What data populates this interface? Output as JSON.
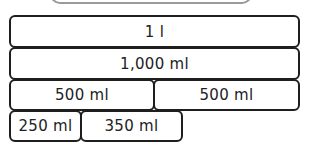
{
  "diagram": {
    "top_box_label": "",
    "rows": [
      {
        "blocks": [
          {
            "label": "1 l"
          }
        ]
      },
      {
        "blocks": [
          {
            "label": "1,000 ml"
          }
        ]
      },
      {
        "blocks": [
          {
            "label": "500 ml"
          },
          {
            "label": "500 ml"
          }
        ]
      },
      {
        "blocks": [
          {
            "label": "250 ml"
          },
          {
            "label": "350 ml"
          }
        ]
      }
    ]
  }
}
